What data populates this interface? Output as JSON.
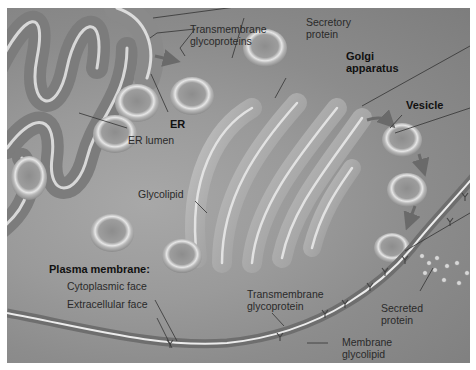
{
  "figure": {
    "labels": {
      "transmembrane_glycoproteins": [
        "Transmembrane",
        "glycoproteins"
      ],
      "secretory_protein": [
        "Secretory",
        "protein"
      ],
      "golgi_apparatus": [
        "Golgi",
        "apparatus"
      ],
      "er": "ER",
      "er_lumen": "ER lumen",
      "vesicle": "Vesicle",
      "glycolipid": "Glycolipid",
      "plasma_membrane": "Plasma membrane:",
      "cytoplasmic_face": "Cytoplasmic face",
      "extracellular_face": "Extracellular face",
      "transmembrane_glycoprotein": [
        "Transmembrane",
        "glycoprotein"
      ],
      "secreted_protein": [
        "Secreted",
        "protein"
      ],
      "membrane_glycolipid": [
        "Membrane",
        "glycolipid"
      ]
    },
    "colors": {
      "background": "#ffffff",
      "cytoplasm": "#9a9a9a",
      "membrane_highlight": "#e8e8e8",
      "organelle": "#b5b5b5",
      "leader_line": "#333333",
      "arrow": "#6a6a6a"
    }
  }
}
